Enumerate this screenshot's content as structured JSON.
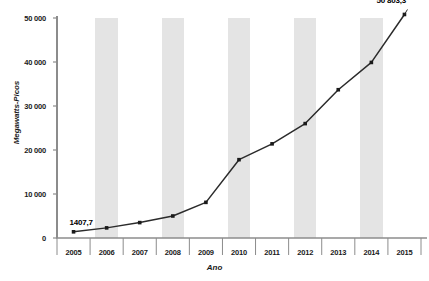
{
  "chart_data": {
    "type": "line",
    "title": "",
    "xlabel": "Ano",
    "ylabel": "Megawatts-Picos",
    "categories": [
      "2005",
      "2006",
      "2007",
      "2008",
      "2009",
      "2010",
      "2011",
      "2012",
      "2013",
      "2014",
      "2015"
    ],
    "values": [
      1407.7,
      2300,
      3500,
      5000,
      8100,
      17800,
      21400,
      26000,
      33700,
      39900,
      50803.3
    ],
    "series": [
      {
        "name": "Megawatts-Picos",
        "values": [
          1407.7,
          2300,
          3500,
          5000,
          8100,
          17800,
          21400,
          26000,
          33700,
          39900,
          50803.3
        ]
      }
    ],
    "ylim": [
      0,
      50000
    ],
    "ytick_values": [
      0,
      10000,
      20000,
      30000,
      40000,
      50000
    ],
    "ytick_labels": [
      "0",
      "10 000",
      "20 000",
      "30 000",
      "40 000",
      "50 000"
    ],
    "xtick_labels": [
      "2005",
      "2006",
      "2007",
      "2008",
      "2009",
      "2010",
      "2011",
      "2012",
      "2013",
      "2014",
      "2015"
    ],
    "point_labels": [
      {
        "category": "2005",
        "text": "1407,7"
      },
      {
        "category": "2015",
        "text": "50 803,3"
      }
    ],
    "grid": false,
    "banded_columns": true,
    "legend": null,
    "colors": {
      "line": "#2b2b2b",
      "marker": "#1a1a1a",
      "band": "#e4e4e4",
      "axis": "#8c8c8c",
      "text": "#1a1a1a",
      "background": "#ffffff"
    }
  },
  "axis_titles": {
    "y": "Megawatts-Picos",
    "x": "Ano"
  },
  "labels": {
    "first_value": "1407,7",
    "last_value": "50 803,3"
  }
}
